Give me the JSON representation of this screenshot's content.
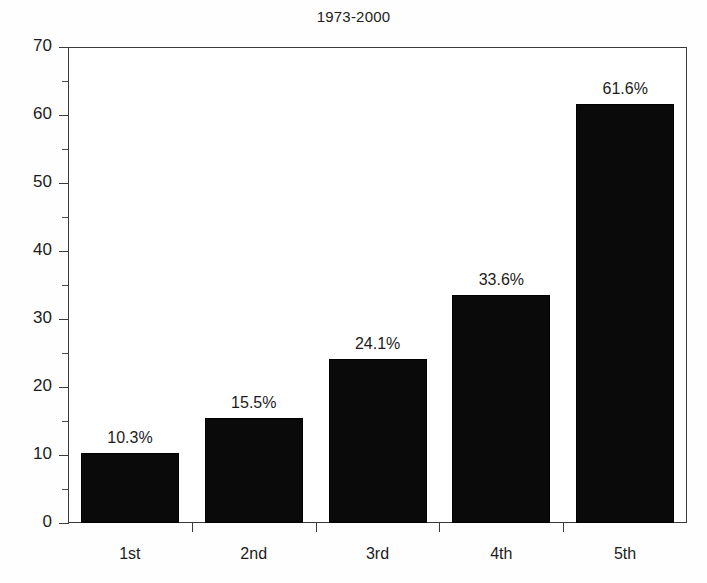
{
  "chart_data": {
    "type": "bar",
    "title": "1973-2000",
    "xlabel": "",
    "ylabel": "",
    "categories": [
      "1st",
      "2nd",
      "3rd",
      "4th",
      "5th"
    ],
    "values": [
      10.3,
      15.5,
      24.1,
      33.6,
      61.6
    ],
    "data_labels": [
      "10.3%",
      "15.5%",
      "24.1%",
      "33.6%",
      "61.6%"
    ],
    "ylim": [
      0,
      70
    ],
    "y_major_ticks": [
      0,
      10,
      20,
      30,
      40,
      50,
      60,
      70
    ],
    "y_tick_labels": [
      "0",
      "10",
      "20",
      "30",
      "40",
      "50",
      "60",
      "70"
    ],
    "y_minor_ticks": [
      5,
      15,
      25,
      35,
      45,
      55,
      65
    ],
    "grid": false,
    "legend": false,
    "bar_color": "#0a0a0a",
    "axis_color": "#3a3a3a",
    "background": "#ffffff"
  }
}
